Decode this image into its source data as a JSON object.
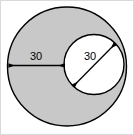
{
  "figure": {
    "kind": "geometry-diagram",
    "canvas": {
      "width": 134,
      "height": 135
    },
    "colors": {
      "shaded_fill": "#c8c8c8",
      "inner_fill": "#ffffff",
      "stroke": "#000000",
      "background": "#ffffff",
      "border": "#d9d9d9"
    },
    "shapes": {
      "outer_circle": {
        "name": "large-shaded-circle",
        "cx": 67,
        "cy": 66.5,
        "r": 59.5,
        "fill": "#c8c8c8",
        "stroke": "#000000",
        "stroke_width": 1.4
      },
      "inner_circle": {
        "name": "small-white-circle",
        "cx": 94,
        "cy": 64.5,
        "r": 30,
        "fill": "#ffffff",
        "stroke": "#000000",
        "stroke_width": 1.4
      }
    },
    "dimensions": [
      {
        "name": "outer-radius-dimension",
        "label": "30",
        "orientation": "horizontal",
        "x1": 9,
        "y1": 65.5,
        "x2": 64.5,
        "y2": 65.5,
        "label_x": 36,
        "label_y": 57,
        "arrowheads": "both"
      },
      {
        "name": "inner-diameter-dimension",
        "label": "30",
        "orientation": "diagonal",
        "x1": 73.5,
        "y1": 86,
        "x2": 115,
        "y2": 44,
        "label_x": 90,
        "label_y": 57,
        "arrowheads": "both"
      }
    ]
  }
}
